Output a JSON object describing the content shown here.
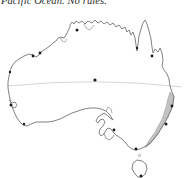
{
  "caption": {
    "text": "Pacific Ocean. No rules.",
    "style": "italic-serif",
    "clipped_top": true
  },
  "map": {
    "title": "Australia outline map",
    "region": "Australia",
    "projection_note": "continental outline with Tasmania",
    "colors": {
      "background": "#ffffff",
      "coastline": "#6b6b6b",
      "coastline_dark": "#3a3a3a",
      "latitude_line": "#c9c9c9",
      "highlight_band": "#9a9a9a",
      "city_dot": "#1a1a1a"
    },
    "latitude_line": {
      "name": "tropic-of-capricorn",
      "label": "",
      "y_fraction": 0.41
    },
    "highlight_band": {
      "name": "east-coast-corridor",
      "label": "",
      "fill": "#9a9a9a",
      "opacity": 0.55
    },
    "cities": [
      {
        "name": "darwin",
        "label": "",
        "x": 77,
        "y": 22
      },
      {
        "name": "broome",
        "label": "",
        "x": 40,
        "y": 45
      },
      {
        "name": "port-hedland",
        "label": "",
        "x": 33,
        "y": 48
      },
      {
        "name": "carnarvon",
        "label": "",
        "x": 10,
        "y": 64
      },
      {
        "name": "perth",
        "label": "",
        "x": 11,
        "y": 97
      },
      {
        "name": "albany",
        "label": "",
        "x": 24,
        "y": 116
      },
      {
        "name": "cairns",
        "label": "",
        "x": 152,
        "y": 48
      },
      {
        "name": "brisbane",
        "label": "",
        "x": 172,
        "y": 98
      },
      {
        "name": "sydney",
        "label": "",
        "x": 166,
        "y": 116
      },
      {
        "name": "adelaide",
        "label": "",
        "x": 114,
        "y": 122
      },
      {
        "name": "melbourne",
        "label": "",
        "x": 136,
        "y": 141
      },
      {
        "name": "hobart",
        "label": "",
        "x": 141,
        "y": 168
      },
      {
        "name": "alice-springs",
        "label": "",
        "x": 95,
        "y": 72
      },
      {
        "name": "weipa",
        "label": "",
        "x": 137,
        "y": 40
      }
    ]
  }
}
